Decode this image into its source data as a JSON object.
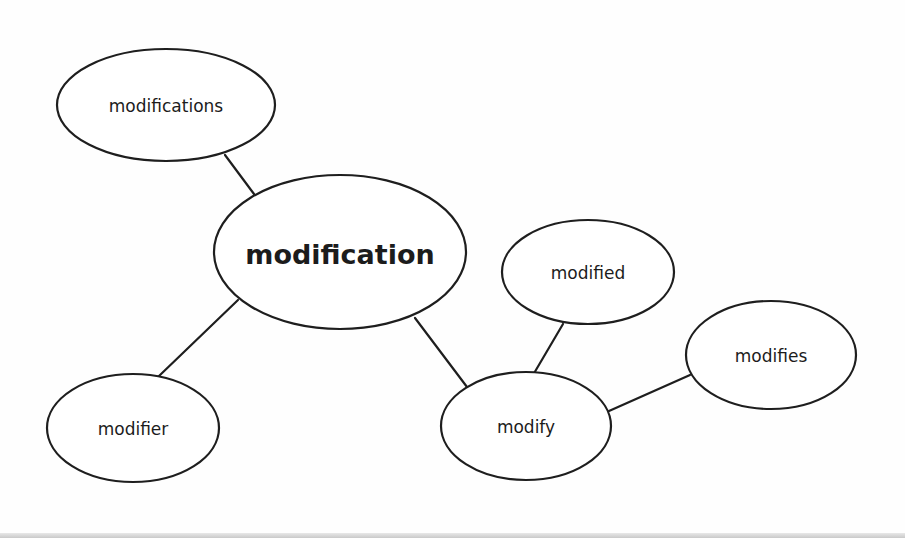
{
  "diagram": {
    "type": "word-family mind map",
    "center": {
      "id": "modification",
      "label": "modification"
    },
    "nodes": [
      {
        "id": "modifications",
        "label": "modifications",
        "cx": 166,
        "cy": 105,
        "rx": 109,
        "ry": 56,
        "kind": "leaf"
      },
      {
        "id": "modification",
        "label": "modification",
        "cx": 340,
        "cy": 252,
        "rx": 126,
        "ry": 77,
        "kind": "center"
      },
      {
        "id": "modifier",
        "label": "modifier",
        "cx": 133,
        "cy": 428,
        "rx": 86,
        "ry": 54,
        "kind": "leaf"
      },
      {
        "id": "modified",
        "label": "modified",
        "cx": 588,
        "cy": 272,
        "rx": 86,
        "ry": 52,
        "kind": "leaf"
      },
      {
        "id": "modify",
        "label": "modify",
        "cx": 526,
        "cy": 426,
        "rx": 85,
        "ry": 54,
        "kind": "leaf"
      },
      {
        "id": "modifies",
        "label": "modifies",
        "cx": 771,
        "cy": 355,
        "rx": 85,
        "ry": 54,
        "kind": "leaf"
      }
    ],
    "edges": [
      {
        "from": "modifications",
        "to": "modification",
        "x1": 225,
        "y1": 155,
        "x2": 254,
        "y2": 194
      },
      {
        "from": "modification",
        "to": "modifier",
        "x1": 238,
        "y1": 300,
        "x2": 159,
        "y2": 376
      },
      {
        "from": "modification",
        "to": "modify",
        "x1": 415,
        "y1": 318,
        "x2": 467,
        "y2": 387
      },
      {
        "from": "modified",
        "to": "modify",
        "x1": 563,
        "y1": 324,
        "x2": 533,
        "y2": 375
      },
      {
        "from": "modify",
        "to": "modifies",
        "x1": 609,
        "y1": 411,
        "x2": 690,
        "y2": 375
      }
    ],
    "colors": {
      "stroke": "#1e1e1e",
      "text": "#1c1c1c",
      "background": "#ffffff"
    }
  }
}
